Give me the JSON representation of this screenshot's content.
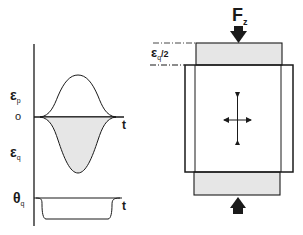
{
  "left_plot": {
    "axis_labels": {
      "epsilon_p": "ε",
      "epsilon_p_sub": "p",
      "zero": "o",
      "epsilon_q": "ε",
      "epsilon_q_sub": "q",
      "theta_q": "θ",
      "theta_q_sub": "q",
      "t_upper": "t",
      "t_lower": "t"
    },
    "curves": [
      {
        "name": "epsilon_p",
        "shape": "positive bell pulse",
        "fill": "none"
      },
      {
        "name": "epsilon_q",
        "shape": "negative bell pulse",
        "fill": "#e6e6e6"
      },
      {
        "name": "theta_q",
        "shape": "negative step pulse",
        "fill": "none"
      }
    ]
  },
  "right_diagram": {
    "force_label": "F",
    "force_sub": "z",
    "strain_label": "ε",
    "strain_sub": "q",
    "strain_fraction": "/2",
    "colors": {
      "line": "#1a1a1a",
      "platen_fill": "#e6e6e6",
      "background": "#ffffff"
    }
  }
}
